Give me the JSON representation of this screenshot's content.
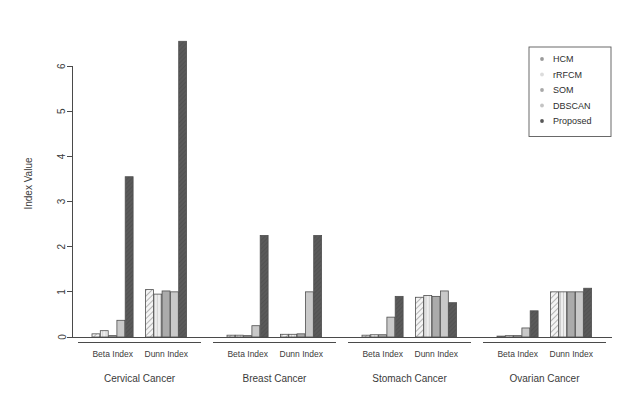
{
  "chart_data": {
    "type": "bar",
    "title": "",
    "xlabel": "",
    "ylabel": "Index Value",
    "ylim": [
      0,
      6.8
    ],
    "yticks": [
      0,
      1,
      2,
      3,
      4,
      5,
      6
    ],
    "ytick_labels": [
      "0",
      "1",
      "2",
      "3",
      "4",
      "5",
      "6"
    ],
    "grid": false,
    "legend_position": "top-right",
    "legend": [
      "HCM",
      "rRFCM",
      "SOM",
      "DBSCAN",
      "Proposed"
    ],
    "series": [
      {
        "name": "HCM",
        "values": [
          0.07,
          1.05,
          0.04,
          0.06,
          0.04,
          0.88,
          0.02,
          1.0
        ]
      },
      {
        "name": "rRFCM",
        "values": [
          0.14,
          0.95,
          0.04,
          0.06,
          0.05,
          0.92,
          0.03,
          1.0
        ]
      },
      {
        "name": "SOM",
        "values": [
          0.03,
          1.02,
          0.03,
          0.07,
          0.05,
          0.9,
          0.03,
          1.0
        ]
      },
      {
        "name": "DBSCAN",
        "values": [
          0.37,
          1.0,
          0.25,
          1.0,
          0.44,
          1.02,
          0.2,
          1.0
        ]
      },
      {
        "name": "Proposed",
        "values": [
          3.55,
          6.55,
          2.25,
          2.25,
          0.9,
          0.76,
          0.58,
          1.08
        ]
      }
    ],
    "categories": [
      "Beta Index",
      "Dunn Index",
      "Beta Index",
      "Dunn Index",
      "Beta Index",
      "Dunn Index",
      "Beta Index",
      "Dunn Index"
    ],
    "groups": [
      {
        "label": "Cervical Cancer",
        "categories": [
          "Beta Index",
          "Dunn Index"
        ]
      },
      {
        "label": "Breast Cancer",
        "categories": [
          "Beta Index",
          "Dunn Index"
        ]
      },
      {
        "label": "Stomach Cancer",
        "categories": [
          "Beta Index",
          "Dunn Index"
        ]
      },
      {
        "label": "Ovarian Cancer",
        "categories": [
          "Beta Index",
          "Dunn Index"
        ]
      }
    ],
    "colors": {
      "HCM": "#e8e8e8",
      "rRFCM": "#dcdcdc",
      "SOM": "#a8a8a8",
      "DBSCAN": "#c4c4c4",
      "Proposed": "#575757",
      "outline": "#4f4f4f",
      "axis": "#4a4a4a",
      "text": "#3b3b3b"
    },
    "patterns": {
      "HCM": "diagonal-hatch",
      "rRFCM": "vertical-lines",
      "SOM": "solid-medium",
      "DBSCAN": "solid-light",
      "Proposed": "diagonal-dark"
    }
  }
}
